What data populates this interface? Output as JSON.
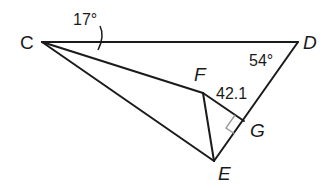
{
  "diagram": {
    "points": {
      "C": {
        "label": "C",
        "x": 42,
        "y": 42
      },
      "D": {
        "label": "D",
        "x": 298,
        "y": 42
      },
      "E": {
        "label": "E",
        "x": 214,
        "y": 161
      },
      "F": {
        "label": "F",
        "x": 203,
        "y": 93
      },
      "G": {
        "label": "G",
        "x": 244,
        "y": 121
      }
    },
    "segments": [
      "CD",
      "DE",
      "CE",
      "CF",
      "FE",
      "FG"
    ],
    "annotations": {
      "angle_C": "17°",
      "angle_D": "54°",
      "length_FG": "42.1",
      "right_angle_at": "G"
    },
    "colors": {
      "line": "#1a1a1a",
      "right_angle_mark": "#9a9a9a"
    }
  }
}
